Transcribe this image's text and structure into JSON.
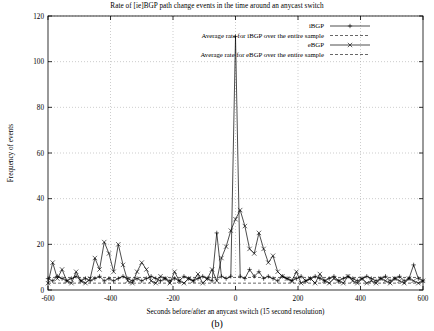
{
  "chart_data": {
    "type": "line",
    "title": "Rate of [ie]BGP path change events in the time around an anycast switch",
    "xlabel": "Seconds before/after an anycast switch (15 second resolution)",
    "ylabel": "Frequency of events",
    "xlim": [
      -600,
      600
    ],
    "ylim": [
      0,
      120
    ],
    "xticks": [
      -600,
      -400,
      -200,
      0,
      200,
      400,
      600
    ],
    "xtick_labels": [
      "-600",
      "-400",
      "-200",
      "0",
      "200",
      "400",
      "600"
    ],
    "yticks": [
      0,
      20,
      40,
      60,
      80,
      100,
      120
    ],
    "ytick_labels": [
      "0",
      "20",
      "40",
      "60",
      "80",
      "100",
      "120"
    ],
    "grid": true,
    "legend_position": "top-right",
    "legend": [
      {
        "name": "iBGP",
        "marker": "plus",
        "style": "line-with-markers"
      },
      {
        "name": "Average rate for iBGP over the entire sample",
        "marker": "none",
        "style": "dashed-horizontal"
      },
      {
        "name": "eBGP",
        "marker": "cross",
        "style": "line-with-markers"
      },
      {
        "name": "Average rate for eBGP over the entire sample",
        "marker": "none",
        "style": "dashed-horizontal"
      }
    ],
    "reference_lines": [
      {
        "name": "Average rate for iBGP over the entire sample",
        "y": 5.5
      },
      {
        "name": "Average rate for eBGP over the entire sample",
        "y": 3.0
      }
    ],
    "series": [
      {
        "name": "iBGP",
        "marker": "plus",
        "x": [
          -600,
          -585,
          -570,
          -555,
          -540,
          -525,
          -510,
          -495,
          -480,
          -465,
          -450,
          -435,
          -420,
          -405,
          -390,
          -375,
          -360,
          -345,
          -330,
          -315,
          -300,
          -285,
          -270,
          -255,
          -240,
          -225,
          -210,
          -195,
          -180,
          -165,
          -150,
          -135,
          -120,
          -105,
          -90,
          -75,
          -60,
          -45,
          -30,
          -15,
          0,
          15,
          30,
          45,
          60,
          75,
          90,
          105,
          120,
          135,
          150,
          165,
          180,
          195,
          210,
          225,
          240,
          255,
          270,
          285,
          300,
          315,
          330,
          345,
          360,
          375,
          390,
          405,
          420,
          435,
          450,
          465,
          480,
          495,
          510,
          525,
          540,
          555,
          570,
          585,
          600
        ],
        "y": [
          5,
          4,
          6,
          5,
          4,
          5,
          6,
          4,
          5,
          4,
          5,
          6,
          4,
          5,
          4,
          5,
          6,
          5,
          4,
          5,
          4,
          5,
          6,
          5,
          4,
          5,
          4,
          5,
          4,
          6,
          5,
          4,
          5,
          6,
          5,
          4,
          25,
          6,
          5,
          6,
          111,
          6,
          5,
          9,
          6,
          8,
          5,
          6,
          5,
          4,
          6,
          5,
          4,
          5,
          6,
          4,
          5,
          6,
          5,
          4,
          5,
          6,
          4,
          5,
          6,
          5,
          4,
          5,
          6,
          5,
          4,
          5,
          6,
          4,
          5,
          6,
          4,
          5,
          11,
          5,
          4
        ]
      },
      {
        "name": "eBGP",
        "marker": "cross",
        "x": [
          -600,
          -585,
          -570,
          -555,
          -540,
          -525,
          -510,
          -495,
          -480,
          -465,
          -450,
          -435,
          -420,
          -405,
          -390,
          -375,
          -360,
          -345,
          -330,
          -315,
          -300,
          -285,
          -270,
          -255,
          -240,
          -225,
          -210,
          -195,
          -180,
          -165,
          -150,
          -135,
          -120,
          -105,
          -90,
          -75,
          -60,
          -45,
          -30,
          -15,
          0,
          15,
          30,
          45,
          60,
          75,
          90,
          105,
          120,
          135,
          150,
          165,
          180,
          195,
          210,
          225,
          240,
          255,
          270,
          285,
          300,
          315,
          330,
          345,
          360,
          375,
          390,
          405,
          420,
          435,
          450,
          465,
          480,
          495,
          510,
          525,
          540,
          555,
          570,
          585,
          600
        ],
        "y": [
          3,
          12,
          5,
          9,
          4,
          3,
          8,
          4,
          3,
          5,
          14,
          9,
          21,
          16,
          8,
          20,
          11,
          4,
          3,
          8,
          12,
          9,
          4,
          3,
          6,
          5,
          3,
          8,
          4,
          3,
          5,
          4,
          7,
          3,
          5,
          9,
          4,
          14,
          19,
          26,
          31,
          35,
          28,
          18,
          16,
          25,
          18,
          12,
          15,
          8,
          6,
          5,
          4,
          8,
          3,
          4,
          5,
          3,
          7,
          4,
          3,
          5,
          4,
          3,
          6,
          4,
          3,
          5,
          3,
          4,
          3,
          5,
          4,
          3,
          5,
          4,
          3,
          5,
          4,
          3,
          4
        ]
      }
    ]
  },
  "caption": "(b)",
  "colors": {
    "foreground": "#000000",
    "grid": "#bfbfbf",
    "background": "#ffffff"
  }
}
